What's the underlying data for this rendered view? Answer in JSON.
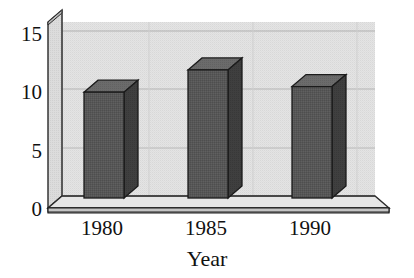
{
  "chart_data": {
    "type": "bar",
    "title": "",
    "subtitle": "",
    "xlabel": "Year",
    "ylabel": "",
    "categories": [
      "1980",
      "1985",
      "1990"
    ],
    "values": [
      9.5,
      11.5,
      10
    ],
    "series": [
      {
        "name": "",
        "values": [
          9.5,
          11.5,
          10
        ]
      }
    ],
    "ylim": [
      0,
      15.8
    ],
    "yticks": [
      0,
      5,
      10,
      15
    ],
    "ytick_labels": [
      "0",
      "5",
      "10",
      "15"
    ],
    "grid": true,
    "grid_axis": "both",
    "legend": false,
    "legend_position": "none",
    "style": "3d-bar",
    "annotations": []
  },
  "axes": {
    "y_ticks": [
      {
        "value": 15,
        "label": "15"
      },
      {
        "value": 10,
        "label": "10"
      },
      {
        "value": 5,
        "label": "5"
      },
      {
        "value": 0,
        "label": "0"
      }
    ],
    "x_categories": [
      {
        "label": "1980"
      },
      {
        "label": "1985"
      },
      {
        "label": "1990"
      }
    ],
    "x_axis_title": "Year"
  },
  "colors": {
    "background": "#ffffff",
    "plot_area": "#e2e2e2",
    "plot_area_shade": "#d6d6d6",
    "wall_face": "#d9d9d9",
    "wall_top": "#efefef",
    "floor_top": "#e8e8e8",
    "floor_side": "#c9c9c9",
    "bar_front": "#585858",
    "bar_side": "#3d3d3d",
    "bar_top": "#6e6e6e",
    "grid_line": "#b6b6b6",
    "axis_line": "#1a1a1a",
    "text": "#111111"
  }
}
